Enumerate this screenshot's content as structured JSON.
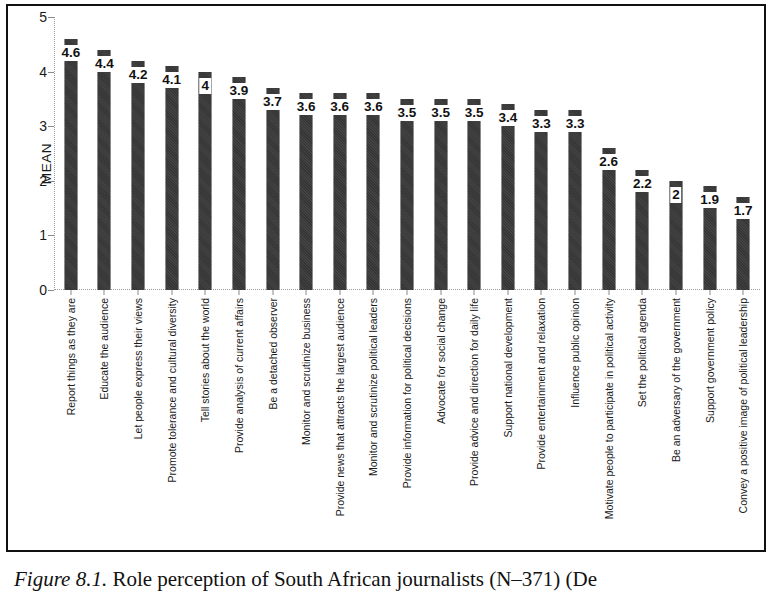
{
  "figure": {
    "caption_label": "Figure 8.1.",
    "caption_text": "Role perception of South African journalists (N–371) (De"
  },
  "chart_data": {
    "type": "bar",
    "title": "",
    "xlabel": "",
    "ylabel": "MEAN",
    "ylim": [
      0,
      5
    ],
    "ytick_labels": [
      "0",
      "1",
      "2",
      "3",
      "4",
      "5"
    ],
    "yticks": [
      0,
      1,
      2,
      3,
      4,
      5
    ],
    "grid": false,
    "legend": "none",
    "orientation": "vertical",
    "bar_color": "#7a7a7a",
    "categories": [
      "Report things as they are",
      "Educate the audience",
      "Let people express their views",
      "Promote tolerance and cultural diversity",
      "Tell stories about the world",
      "Provide analysis of current affairs",
      "Be a detached observer",
      "Monitor and scrutinize business",
      "Provide news that attracts the largest audience",
      "Monitor and scrutinize political leaders",
      "Provide information for political decisions",
      "Advocate for social change",
      "Provide advice and direction for daily life",
      "Support national development",
      "Provide entertainment and relaxation",
      "Influence public opinion",
      "Motivate people to participate in political activity",
      "Set the political agenda",
      "Be an adversary of the government",
      "Support government policy",
      "Convey a positive image of political leadership"
    ],
    "values": [
      4.6,
      4.4,
      4.2,
      4.1,
      4.0,
      3.9,
      3.7,
      3.6,
      3.6,
      3.6,
      3.5,
      3.5,
      3.5,
      3.4,
      3.3,
      3.3,
      2.6,
      2.2,
      2.0,
      1.9,
      1.7
    ],
    "value_labels": [
      "4.6",
      "4.4",
      "4.2",
      "4.1",
      "4",
      "3.9",
      "3.7",
      "3.6",
      "3.6",
      "3.6",
      "3.5",
      "3.5",
      "3.5",
      "3.4",
      "3.3",
      "3.3",
      "2.6",
      "2.2",
      "2",
      "1.9",
      "1.7"
    ]
  }
}
